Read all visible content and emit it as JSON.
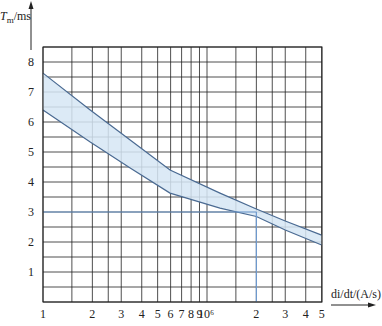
{
  "chart_data": {
    "type": "area",
    "title": "",
    "ylabel": "T_m/ms",
    "ylabel_main": "T",
    "ylabel_sub": "m",
    "ylabel_unit": "/ms",
    "xlabel": "di/dt/(A/s)",
    "x_scale": "log",
    "xlim": [
      100000,
      5000000
    ],
    "ylim": [
      0,
      8.5
    ],
    "grid": true,
    "legend": null,
    "x_tick_labels": [
      "1",
      "2",
      "3",
      "4",
      "5",
      "6",
      "7",
      "8",
      "9",
      "10⁶",
      "2",
      "3",
      "4",
      "5"
    ],
    "x_tick_values": [
      100000,
      200000,
      300000,
      400000,
      500000,
      600000,
      700000,
      800000,
      900000,
      1000000,
      2000000,
      3000000,
      4000000,
      5000000
    ],
    "x_minor_grid_values": [
      150000,
      250000,
      1500000,
      2500000
    ],
    "y_tick_labels": [
      "1",
      "2",
      "3",
      "4",
      "5",
      "6",
      "7",
      "8"
    ],
    "y_tick_values": [
      1,
      2,
      3,
      4,
      5,
      6,
      7,
      8
    ],
    "y_grid_step": 0.5,
    "series": [
      {
        "name": "upper bound",
        "x": [
          100000,
          194000,
          340000,
          595000,
          1200000,
          2000000,
          3000000,
          5000000
        ],
        "y": [
          7.63,
          6.4,
          5.4,
          4.4,
          3.63,
          3.1,
          2.7,
          2.23
        ]
      },
      {
        "name": "lower bound",
        "x": [
          100000,
          194000,
          340000,
          595000,
          1200000,
          2000000,
          3000000,
          5000000
        ],
        "y": [
          6.4,
          5.33,
          4.47,
          3.63,
          3.13,
          2.85,
          2.4,
          1.9
        ]
      }
    ],
    "annotations": [
      {
        "type": "reference-line",
        "description": "horizontal guide at T=3 ms up to di/dt=2×10⁶ A/s, then vertical down to axis",
        "x": 2000000,
        "y": 3
      }
    ],
    "colors": {
      "band_fill": "#d6e6f4",
      "band_edge": "#4a6a92",
      "reference": "#6f9bd1",
      "grid": "#222222"
    }
  }
}
